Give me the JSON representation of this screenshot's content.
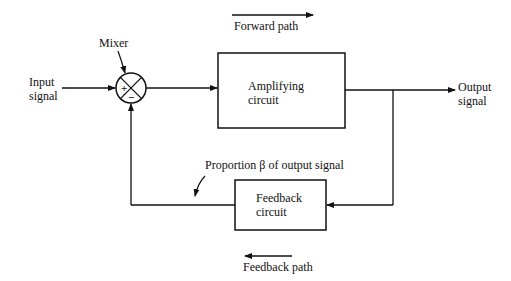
{
  "diagram": {
    "type": "feedback-block-diagram",
    "labels": {
      "forward_path": "Forward path",
      "feedback_path": "Feedback path",
      "mixer": "Mixer",
      "input_line1": "Input",
      "input_line2": "signal",
      "output_line1": "Output",
      "output_line2": "signal",
      "proportion": "Proportion β of output signal"
    },
    "blocks": [
      {
        "id": "amplifier",
        "line1": "Amplifying",
        "line2": "circuit"
      },
      {
        "id": "feedback",
        "line1": "Feedback",
        "line2": "circuit"
      }
    ],
    "mixer_signs": {
      "plus": "+",
      "minus": "−"
    },
    "colors": {
      "stroke": "#111111",
      "background": "#ffffff"
    }
  }
}
